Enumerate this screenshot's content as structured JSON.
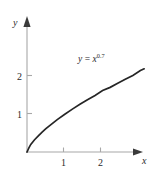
{
  "chart_data": {
    "type": "line",
    "title": "",
    "subtitle": "",
    "xlabel": "x",
    "ylabel": "y",
    "xlim": [
      0,
      3.3
    ],
    "ylim": [
      0,
      2.45
    ],
    "grid": false,
    "legend": null,
    "annotations": [
      {
        "id": "curve-equation",
        "base": "y = x",
        "lhs": "y",
        "equals": "=",
        "variable": "x",
        "exponent": "0.7",
        "text": "y = x^0.7",
        "x": 1.75,
        "y": 2.25
      }
    ],
    "x_ticks": [
      {
        "value": 1,
        "label": "1"
      },
      {
        "value": 2,
        "label": "2"
      }
    ],
    "y_ticks": [
      {
        "value": 1,
        "label": "1"
      },
      {
        "value": 2,
        "label": "2"
      }
    ],
    "series": [
      {
        "name": "y = x^0.7",
        "exponent": 0.7,
        "color": "#262626",
        "x": [
          0,
          0.05,
          0.1,
          0.2,
          0.3,
          0.4,
          0.5,
          0.6,
          0.8,
          1.0,
          1.2,
          1.4,
          1.6,
          1.8,
          2.0,
          2.2,
          2.4,
          2.6,
          2.8,
          3.0,
          3.1
        ],
        "y": [
          0,
          0.111,
          0.2,
          0.324,
          0.427,
          0.525,
          0.616,
          0.699,
          0.858,
          1.0,
          1.135,
          1.261,
          1.381,
          1.495,
          1.625,
          1.71,
          1.82,
          1.925,
          2.025,
          2.158,
          2.2
        ]
      }
    ],
    "axis_colors": {
      "axis": "#a8a8a8",
      "curve": "#262626",
      "text": "#2b2b2b",
      "arrow": "#3a3a3a",
      "background": "#ffffff"
    }
  }
}
